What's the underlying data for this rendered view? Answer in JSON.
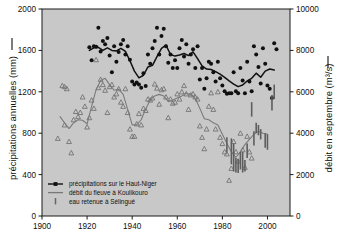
{
  "chart_data": {
    "type": "scatter",
    "title": "",
    "xlabel": "",
    "ylabel_left": "précipitations annuelles (mm)",
    "ylabel_right": "débit en septembre (m3/s)",
    "ylabel_right_display": "débit en septembre (m³/s)",
    "xlim": [
      1900,
      2010
    ],
    "ylim_left": [
      0,
      2000
    ],
    "ylim_right": [
      0,
      10000
    ],
    "grid": false,
    "legend_position": "lower-left",
    "xticks": [
      1900,
      1920,
      1940,
      1960,
      1980,
      2000
    ],
    "yticks_left": [
      0,
      400,
      800,
      1200,
      1600,
      2000
    ],
    "yticks_right": [
      0,
      2000,
      4000,
      6000,
      8000,
      10000
    ],
    "plot_bg": "#c8c8c8",
    "legend": [
      {
        "label": "précipitations sur le Haut-Niger",
        "marker": "line-square",
        "color": "#101010"
      },
      {
        "label": "débit du fleuve à Koulikouro",
        "marker": "line",
        "color": "#777777"
      },
      {
        "label": "eau retenue à Sélingué",
        "marker": "vbar",
        "color": "#666666"
      }
    ],
    "series": [
      {
        "name": "précipitations sur le Haut-Niger",
        "kind": "scatter",
        "axis": "left",
        "color": "#101010",
        "marker": "circle",
        "points": [
          [
            1921,
            1630
          ],
          [
            1922,
            1505
          ],
          [
            1923,
            1640
          ],
          [
            1924,
            1635
          ],
          [
            1925,
            1820
          ],
          [
            1926,
            1590
          ],
          [
            1927,
            1690
          ],
          [
            1928,
            1660
          ],
          [
            1929,
            1720
          ],
          [
            1930,
            1550
          ],
          [
            1931,
            1390
          ],
          [
            1932,
            1640
          ],
          [
            1933,
            1490
          ],
          [
            1934,
            1585
          ],
          [
            1935,
            1660
          ],
          [
            1936,
            1700
          ],
          [
            1937,
            1560
          ],
          [
            1938,
            1640
          ],
          [
            1939,
            1510
          ],
          [
            1940,
            1300
          ],
          [
            1941,
            1270
          ],
          [
            1942,
            1290
          ],
          [
            1943,
            1270
          ],
          [
            1944,
            1240
          ],
          [
            1945,
            1380
          ],
          [
            1946,
            1255
          ],
          [
            1947,
            1560
          ],
          [
            1948,
            1470
          ],
          [
            1949,
            1620
          ],
          [
            1950,
            1690
          ],
          [
            1951,
            1820
          ],
          [
            1952,
            1560
          ],
          [
            1953,
            1740
          ],
          [
            1954,
            1810
          ],
          [
            1955,
            1640
          ],
          [
            1956,
            1480
          ],
          [
            1957,
            1560
          ],
          [
            1958,
            1430
          ],
          [
            1959,
            1505
          ],
          [
            1960,
            1430
          ],
          [
            1961,
            1620
          ],
          [
            1962,
            1700
          ],
          [
            1963,
            1540
          ],
          [
            1964,
            1660
          ],
          [
            1965,
            1470
          ],
          [
            1966,
            1560
          ],
          [
            1967,
            1610
          ],
          [
            1968,
            1430
          ],
          [
            1969,
            1640
          ],
          [
            1970,
            1320
          ],
          [
            1971,
            1430
          ],
          [
            1972,
            1230
          ],
          [
            1973,
            1330
          ],
          [
            1974,
            1490
          ],
          [
            1975,
            1470
          ],
          [
            1976,
            1390
          ],
          [
            1977,
            1300
          ],
          [
            1978,
            1490
          ],
          [
            1979,
            1330
          ],
          [
            1980,
            1260
          ],
          [
            1981,
            1205
          ],
          [
            1982,
            1180
          ],
          [
            1983,
            1185
          ],
          [
            1984,
            1185
          ],
          [
            1985,
            1390
          ],
          [
            1986,
            1205
          ],
          [
            1987,
            1185
          ],
          [
            1988,
            1430
          ],
          [
            1989,
            1310
          ],
          [
            1990,
            1185
          ],
          [
            1991,
            1490
          ],
          [
            1992,
            1300
          ],
          [
            1993,
            1205
          ],
          [
            1994,
            1640
          ],
          [
            1995,
            1560
          ],
          [
            1996,
            1440
          ],
          [
            1997,
            1280
          ],
          [
            1998,
            1620
          ],
          [
            1999,
            1470
          ],
          [
            2000,
            1260
          ],
          [
            2001,
            1230
          ],
          [
            2002,
            1140
          ],
          [
            2003,
            1670
          ],
          [
            2004,
            1610
          ]
        ]
      },
      {
        "name": "précipitations — moyenne mobile",
        "kind": "line",
        "axis": "left",
        "color": "#101010",
        "values": [
          [
            1921,
            1600
          ],
          [
            1923,
            1625
          ],
          [
            1925,
            1630
          ],
          [
            1927,
            1600
          ],
          [
            1929,
            1625
          ],
          [
            1931,
            1600
          ],
          [
            1933,
            1595
          ],
          [
            1935,
            1620
          ],
          [
            1937,
            1590
          ],
          [
            1939,
            1500
          ],
          [
            1941,
            1400
          ],
          [
            1943,
            1335
          ],
          [
            1945,
            1360
          ],
          [
            1947,
            1440
          ],
          [
            1949,
            1455
          ],
          [
            1951,
            1540
          ],
          [
            1953,
            1620
          ],
          [
            1955,
            1650
          ],
          [
            1957,
            1560
          ],
          [
            1959,
            1545
          ],
          [
            1961,
            1555
          ],
          [
            1963,
            1570
          ],
          [
            1965,
            1550
          ],
          [
            1967,
            1585
          ],
          [
            1969,
            1520
          ],
          [
            1971,
            1450
          ],
          [
            1973,
            1420
          ],
          [
            1975,
            1415
          ],
          [
            1977,
            1395
          ],
          [
            1979,
            1370
          ],
          [
            1981,
            1340
          ],
          [
            1983,
            1305
          ],
          [
            1985,
            1275
          ],
          [
            1987,
            1250
          ],
          [
            1989,
            1265
          ],
          [
            1991,
            1305
          ],
          [
            1993,
            1330
          ],
          [
            1995,
            1380
          ],
          [
            1997,
            1340
          ],
          [
            1999,
            1400
          ],
          [
            2001,
            1420
          ],
          [
            2003,
            1410
          ]
        ]
      },
      {
        "name": "débit du fleuve à Koulikouro",
        "kind": "scatter",
        "axis": "left",
        "color": "#6f6f6f",
        "marker": "triangle",
        "points": [
          [
            1907,
            750
          ],
          [
            1909,
            1260
          ],
          [
            1910,
            1250
          ],
          [
            1910,
            880
          ],
          [
            1911,
            1230
          ],
          [
            1912,
            720
          ],
          [
            1913,
            610
          ],
          [
            1914,
            930
          ],
          [
            1915,
            1010
          ],
          [
            1916,
            960
          ],
          [
            1917,
            1000
          ],
          [
            1918,
            1150
          ],
          [
            1919,
            1060
          ],
          [
            1920,
            860
          ],
          [
            1921,
            950
          ],
          [
            1922,
            1120
          ],
          [
            1923,
            1040
          ],
          [
            1924,
            1510
          ],
          [
            1925,
            1240
          ],
          [
            1926,
            1320
          ],
          [
            1927,
            1270
          ],
          [
            1928,
            1215
          ],
          [
            1929,
            1000
          ],
          [
            1930,
            1250
          ],
          [
            1931,
            1270
          ],
          [
            1932,
            1150
          ],
          [
            1933,
            1180
          ],
          [
            1934,
            1230
          ],
          [
            1935,
            1100
          ],
          [
            1936,
            1060
          ],
          [
            1937,
            1230
          ],
          [
            1938,
            1000
          ],
          [
            1939,
            840
          ],
          [
            1940,
            770
          ],
          [
            1941,
            770
          ],
          [
            1942,
            890
          ],
          [
            1943,
            990
          ],
          [
            1944,
            880
          ],
          [
            1945,
            1040
          ],
          [
            1946,
            1020
          ],
          [
            1947,
            1130
          ],
          [
            1948,
            1120
          ],
          [
            1949,
            1140
          ],
          [
            1950,
            1275
          ],
          [
            1951,
            1235
          ],
          [
            1952,
            1080
          ],
          [
            1953,
            1220
          ],
          [
            1954,
            1230
          ],
          [
            1955,
            1150
          ],
          [
            1956,
            950
          ],
          [
            1957,
            1130
          ],
          [
            1958,
            1090
          ],
          [
            1959,
            1100
          ],
          [
            1960,
            1180
          ],
          [
            1961,
            1130
          ],
          [
            1962,
            1200
          ],
          [
            1963,
            1260
          ],
          [
            1964,
            1180
          ],
          [
            1965,
            1030
          ],
          [
            1966,
            1170
          ],
          [
            1967,
            1180
          ],
          [
            1968,
            1150
          ],
          [
            1969,
            1130
          ],
          [
            1970,
            870
          ],
          [
            1971,
            760
          ],
          [
            1972,
            650
          ],
          [
            1973,
            840
          ],
          [
            1974,
            1060
          ],
          [
            1975,
            1190
          ],
          [
            1976,
            1030
          ],
          [
            1977,
            840
          ],
          [
            1978,
            1200
          ],
          [
            1979,
            760
          ],
          [
            1980,
            700
          ],
          [
            1981,
            620
          ],
          [
            1982,
            600
          ],
          [
            1983,
            345
          ],
          [
            1984,
            460
          ],
          [
            1985,
            720
          ],
          [
            1986,
            620
          ],
          [
            1987,
            530
          ],
          [
            1988,
            800
          ],
          [
            1989,
            640
          ],
          [
            1990,
            470
          ],
          [
            1991,
            770
          ],
          [
            1992,
            620
          ],
          [
            1993,
            560
          ]
        ]
      },
      {
        "name": "débit — moyenne mobile",
        "kind": "line",
        "axis": "left",
        "color": "#7a7a7a",
        "values": [
          [
            1908,
            960
          ],
          [
            1910,
            900
          ],
          [
            1912,
            845
          ],
          [
            1914,
            900
          ],
          [
            1916,
            930
          ],
          [
            1918,
            925
          ],
          [
            1920,
            890
          ],
          [
            1922,
            1060
          ],
          [
            1924,
            1220
          ],
          [
            1926,
            1310
          ],
          [
            1928,
            1330
          ],
          [
            1930,
            1270
          ],
          [
            1932,
            1215
          ],
          [
            1934,
            1225
          ],
          [
            1936,
            1175
          ],
          [
            1938,
            1030
          ],
          [
            1940,
            880
          ],
          [
            1942,
            880
          ],
          [
            1944,
            930
          ],
          [
            1946,
            1035
          ],
          [
            1948,
            1120
          ],
          [
            1950,
            1160
          ],
          [
            1952,
            1175
          ],
          [
            1954,
            1160
          ],
          [
            1956,
            1105
          ],
          [
            1958,
            1120
          ],
          [
            1960,
            1140
          ],
          [
            1962,
            1160
          ],
          [
            1964,
            1185
          ],
          [
            1966,
            1175
          ],
          [
            1968,
            1135
          ],
          [
            1970,
            1040
          ],
          [
            1972,
            940
          ],
          [
            1974,
            930
          ],
          [
            1976,
            900
          ],
          [
            1978,
            880
          ],
          [
            1980,
            790
          ],
          [
            1982,
            700
          ],
          [
            1984,
            620
          ],
          [
            1986,
            565
          ],
          [
            1988,
            620
          ],
          [
            1990,
            690
          ],
          [
            1992,
            740
          ],
          [
            1994,
            790
          ],
          [
            1996,
            820
          ],
          [
            1998,
            800
          ],
          [
            2000,
            790
          ]
        ]
      },
      {
        "name": "eau retenue à Sélingué",
        "kind": "vbar",
        "axis": "left",
        "color": "#5e5e5e",
        "bars": [
          [
            1982,
            620,
            760
          ],
          [
            1984,
            500,
            750
          ],
          [
            1985,
            430,
            700
          ],
          [
            1986,
            420,
            560
          ],
          [
            1987,
            415,
            550
          ],
          [
            1988,
            450,
            620
          ],
          [
            1989,
            420,
            620
          ],
          [
            1990,
            430,
            540
          ],
          [
            1991,
            560,
            700
          ],
          [
            1993,
            960,
            1100
          ],
          [
            1994,
            680,
            820
          ],
          [
            1995,
            800,
            900
          ],
          [
            1996,
            780,
            880
          ],
          [
            1997,
            740,
            840
          ],
          [
            1999,
            660,
            800
          ],
          [
            2000,
            640,
            790
          ],
          [
            2002,
            1020,
            1170
          ],
          [
            2003,
            1130,
            1270
          ]
        ]
      }
    ]
  }
}
